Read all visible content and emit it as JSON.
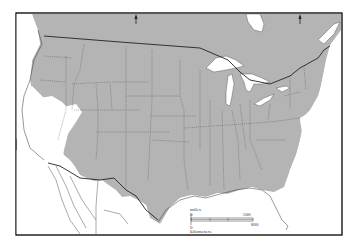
{
  "map": {
    "type": "range-map",
    "region": "Conterminous United States with adjacent Canada and Mexico",
    "colors": {
      "range_fill": "#b4b4b4",
      "land_outside": "#ffffff",
      "water": "#ffffff",
      "border": "#333333",
      "state_line": "#555555"
    },
    "north_arrows": [
      {
        "symbol": "north-arrow"
      },
      {
        "symbol": "north-arrow"
      }
    ],
    "scale_bar": {
      "miles_label": "miles",
      "kilometers_label": "kilometers",
      "miles_zero": "0",
      "miles_max": "500",
      "km_zero": "0",
      "km_max": "800"
    }
  }
}
